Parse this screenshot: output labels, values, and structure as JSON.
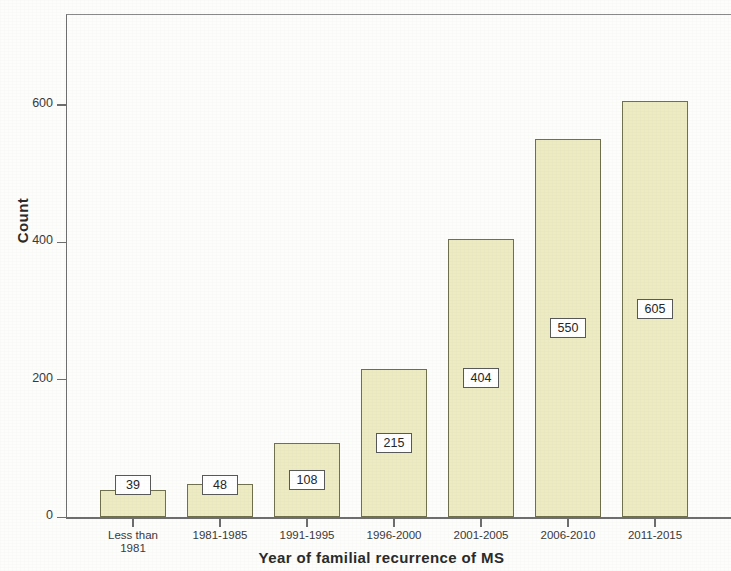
{
  "chart_data": {
    "type": "bar",
    "title": "",
    "xlabel": "Year of familial recurrence of MS",
    "ylabel": "Count",
    "categories": [
      "Less than\n1981",
      "1981-1985",
      "1991-1995",
      "1996-2000",
      "2001-2005",
      "2006-2010",
      "2011-2015"
    ],
    "values": [
      39,
      48,
      108,
      215,
      404,
      550,
      605
    ],
    "data_labels": [
      "39",
      "48",
      "108",
      "215",
      "404",
      "550",
      "605"
    ],
    "ylim": [
      0,
      732
    ],
    "y_ticks": [
      0,
      200,
      400,
      600
    ],
    "y_tick_labels": [
      "0",
      "200",
      "400",
      "600"
    ],
    "grid": false,
    "legend": null,
    "bar_fill_color": "#ecebc2",
    "bar_border_color": "#71714f",
    "axis_color": "#6e6e6e",
    "label_box_border_color": "#59595a",
    "label_box_fill_color": "#ffffff",
    "text_color": "#3a3a3a"
  }
}
